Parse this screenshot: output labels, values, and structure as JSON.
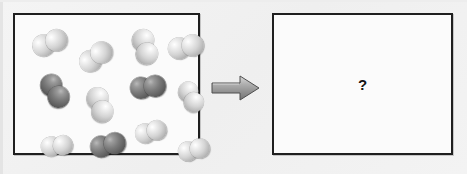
{
  "diagram": {
    "kind": "particulate-reaction-diagram",
    "background_color": "#f1f1f1",
    "border_color": "#1f1f1f",
    "box_fill_color": "#fbfbfb",
    "reactant_box": {
      "label": "reactant-container",
      "molecule_count": 12,
      "dark_molecule_count": 3,
      "light_molecule_count": 9,
      "legend": {
        "light_color": "#d4d4d4",
        "dark_color": "#5e5e5e"
      },
      "molecules": [
        {
          "id": "m1",
          "shade": "light",
          "cx": 35,
          "cy": 28,
          "angle": -22,
          "r": 11
        },
        {
          "id": "m2",
          "shade": "light",
          "cx": 81,
          "cy": 42,
          "angle": -38,
          "r": 11
        },
        {
          "id": "m3",
          "shade": "light",
          "cx": 130,
          "cy": 32,
          "angle": 74,
          "r": 11
        },
        {
          "id": "m4",
          "shade": "light",
          "cx": 171,
          "cy": 32,
          "angle": -12,
          "r": 11
        },
        {
          "id": "m5",
          "shade": "dark",
          "cx": 40,
          "cy": 76,
          "angle": 58,
          "r": 11
        },
        {
          "id": "m6",
          "shade": "light",
          "cx": 85,
          "cy": 90,
          "angle": 70,
          "r": 11
        },
        {
          "id": "m7",
          "shade": "dark",
          "cx": 133,
          "cy": 72,
          "angle": -8,
          "r": 11
        },
        {
          "id": "m8",
          "shade": "light",
          "cx": 176,
          "cy": 82,
          "angle": 62,
          "r": 10
        },
        {
          "id": "m9",
          "shade": "light",
          "cx": 42,
          "cy": 131,
          "angle": -6,
          "r": 10
        },
        {
          "id": "m10",
          "shade": "dark",
          "cx": 93,
          "cy": 130,
          "angle": -14,
          "r": 11
        },
        {
          "id": "m11",
          "shade": "light",
          "cx": 136,
          "cy": 117,
          "angle": -16,
          "r": 10
        },
        {
          "id": "m12",
          "shade": "light",
          "cx": 179,
          "cy": 135,
          "angle": -14,
          "r": 10
        }
      ]
    },
    "arrow": {
      "label": "reaction-arrow",
      "direction": "right",
      "fill_color": "#9c9c9c",
      "outline_color": "#4a4a4a"
    },
    "product_box": {
      "label": "product-container",
      "content_text": "?",
      "is_empty": true
    }
  }
}
